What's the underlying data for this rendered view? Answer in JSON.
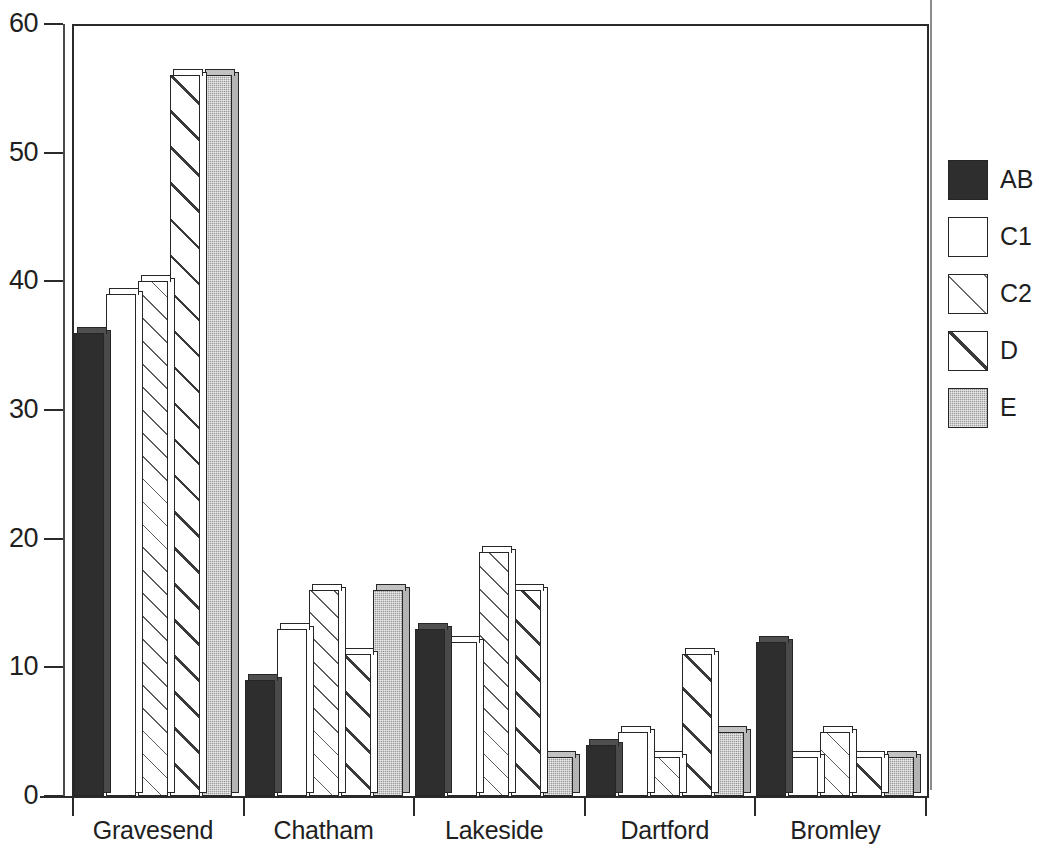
{
  "chart_data": {
    "type": "bar",
    "title": "",
    "xlabel": "",
    "ylabel": "",
    "ylim": [
      0,
      60
    ],
    "yticks": [
      0,
      10,
      20,
      30,
      40,
      50,
      60
    ],
    "grid": false,
    "legend_position": "right",
    "categories": [
      "Gravesend",
      "Chatham",
      "Lakeside",
      "Dartford",
      "Bromley"
    ],
    "series": [
      {
        "name": "AB",
        "values": [
          36,
          9,
          13,
          4,
          12
        ]
      },
      {
        "name": "C1",
        "values": [
          39,
          13,
          12,
          5,
          3
        ]
      },
      {
        "name": "C2",
        "values": [
          40,
          16,
          19,
          3,
          5
        ]
      },
      {
        "name": "D",
        "values": [
          56,
          11,
          16,
          11,
          3
        ]
      },
      {
        "name": "E",
        "values": [
          56,
          16,
          3,
          5,
          3
        ]
      }
    ]
  },
  "axis": {
    "y_tick_labels": [
      "60",
      "50",
      "40",
      "30",
      "20",
      "10",
      "0"
    ],
    "x_tick_labels": [
      "Gravesend",
      "Chatham",
      "Lakeside",
      "Dartford",
      "Bromley"
    ]
  },
  "legend": {
    "entries": [
      {
        "label": "AB",
        "swatch": "solid-dark-swatch",
        "color": "#2e2e2e"
      },
      {
        "label": "C1",
        "swatch": "empty-white-swatch",
        "color": "#ffffff"
      },
      {
        "label": "C2",
        "swatch": "thin-hatch-swatch",
        "color": "#6a6a6a"
      },
      {
        "label": "D",
        "swatch": "bold-hatch-swatch",
        "color": "#3a3a3a"
      },
      {
        "label": "E",
        "swatch": "gray-stipple-swatch",
        "color": "#9a9a9a"
      }
    ]
  },
  "title_remnant": ""
}
